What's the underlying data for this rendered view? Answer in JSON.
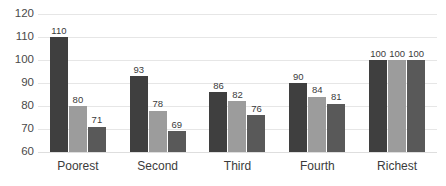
{
  "chart_data": {
    "type": "bar",
    "title": "",
    "xlabel": "",
    "ylabel": "",
    "categories": [
      "Poorest",
      "Second",
      "Third",
      "Fourth",
      "Richest"
    ],
    "series": [
      {
        "name": "series-1",
        "color": "#3f3f3f",
        "values": [
          110,
          93,
          86,
          90,
          100
        ]
      },
      {
        "name": "series-2",
        "color": "#9c9c9c",
        "values": [
          80,
          78,
          82,
          84,
          100
        ]
      },
      {
        "name": "series-3",
        "color": "#595959",
        "values": [
          71,
          69,
          76,
          81,
          100
        ]
      }
    ],
    "ylim": [
      60,
      120
    ],
    "ytick_labels": [
      "120",
      "110",
      "100",
      "90",
      "80",
      "70",
      "60"
    ],
    "ytick_values": [
      120,
      110,
      100,
      90,
      80,
      70,
      60
    ],
    "grid": true,
    "legend": "none",
    "data_labels": true,
    "gridline_color": "#e6e6e6",
    "axis_color": "#dedede",
    "label_color": "#3b3b3b",
    "background": "#ffffff"
  }
}
